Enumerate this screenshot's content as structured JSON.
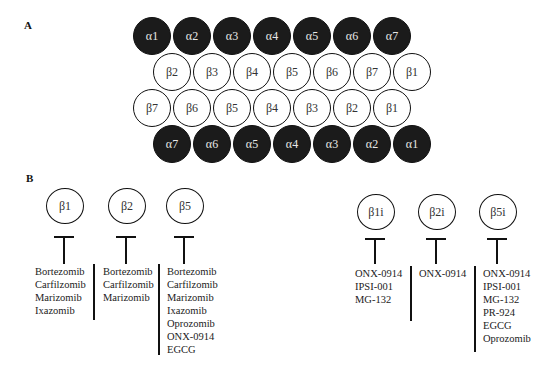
{
  "panel_a": {
    "label": "A",
    "rows": [
      {
        "type": "alpha",
        "subunits": [
          "α1",
          "α2",
          "α3",
          "α4",
          "α5",
          "α6",
          "α7"
        ]
      },
      {
        "type": "beta",
        "subunits": [
          "β2",
          "β3",
          "β4",
          "β5",
          "β6",
          "β7",
          "β1"
        ]
      },
      {
        "type": "beta",
        "subunits": [
          "β7",
          "β6",
          "β5",
          "β4",
          "β3",
          "β2",
          "β1"
        ]
      },
      {
        "type": "alpha",
        "subunits": [
          "α7",
          "α6",
          "α5",
          "α4",
          "α3",
          "α2",
          "α1"
        ]
      }
    ]
  },
  "panel_b": {
    "label": "B",
    "constitutive": [
      {
        "subunit": "β1",
        "inhibitors": [
          "Bortezomib",
          "Carfilzomib",
          "Marizomib",
          "Ixazomib"
        ]
      },
      {
        "subunit": "β2",
        "inhibitors": [
          "Bortezomib",
          "Carfilzomib",
          "Marizomib"
        ]
      },
      {
        "subunit": "β5",
        "inhibitors": [
          "Bortezomib",
          "Carfilzomib",
          "Marizomib",
          "Ixazomib",
          "Oprozomib",
          "ONX-0914",
          "EGCG"
        ]
      }
    ],
    "immuno": [
      {
        "subunit": "β1i",
        "inhibitors": [
          "ONX-0914",
          "IPSI-001",
          "MG-132"
        ]
      },
      {
        "subunit": "β2i",
        "inhibitors": [
          "ONX-0914"
        ]
      },
      {
        "subunit": "β5i",
        "inhibitors": [
          "ONX-0914",
          "IPSI-001",
          "MG-132",
          "PR-924",
          "EGCG",
          "Oprozomib"
        ]
      }
    ]
  }
}
